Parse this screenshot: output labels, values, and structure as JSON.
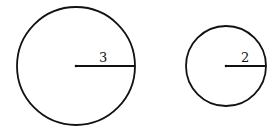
{
  "diagram": {
    "type": "two circles with radii",
    "circles": [
      {
        "id": "large",
        "radius_label": "3",
        "cx": 76,
        "cy": 66,
        "r": 59
      },
      {
        "id": "small",
        "radius_label": "2",
        "cx": 226,
        "cy": 66,
        "r": 40
      }
    ],
    "stroke_color": "#111111",
    "background": "#ffffff"
  }
}
